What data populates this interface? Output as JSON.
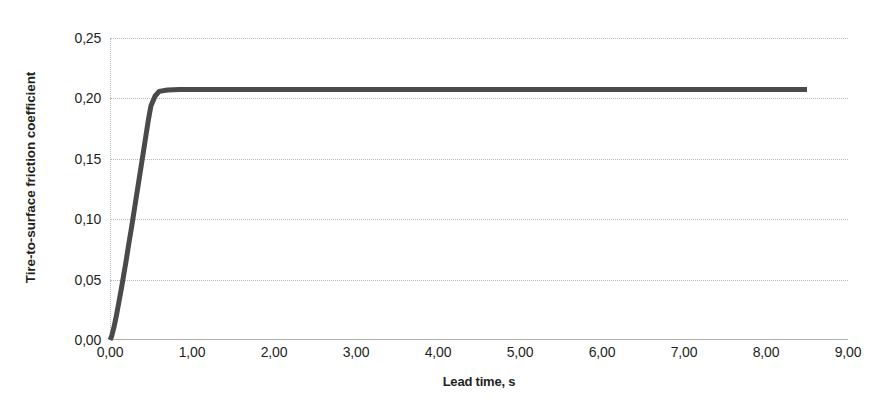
{
  "chart_data": {
    "type": "line",
    "title": "",
    "xlabel": "Lead time, s",
    "ylabel": "Tire-to-surface friction coefficient",
    "xlim": [
      0,
      9
    ],
    "ylim": [
      0,
      0.25
    ],
    "grid": true,
    "legend": false,
    "legend_position": "none",
    "decimal_separator": ",",
    "xticks": [
      0,
      1,
      2,
      3,
      4,
      5,
      6,
      7,
      8,
      9
    ],
    "xtick_labels": [
      "0,00",
      "1,00",
      "2,00",
      "3,00",
      "4,00",
      "5,00",
      "6,00",
      "7,00",
      "8,00",
      "9,00"
    ],
    "yticks": [
      0,
      0.05,
      0.1,
      0.15,
      0.2,
      0.25
    ],
    "ytick_labels": [
      "0,00",
      "0,05",
      "0,10",
      "0,15",
      "0,20",
      "0,25"
    ],
    "series": [
      {
        "name": "Tire-to-surface friction coefficient",
        "color": "#4a4a4a",
        "line_width": 5,
        "x": [
          0.0,
          0.02,
          0.05,
          0.08,
          0.11,
          0.14,
          0.17,
          0.2,
          0.23,
          0.26,
          0.29,
          0.32,
          0.35,
          0.38,
          0.41,
          0.44,
          0.47,
          0.5,
          0.55,
          0.6,
          0.7,
          0.85,
          1.0,
          1.5,
          2.0,
          2.5,
          3.0,
          3.5,
          4.0,
          4.5,
          5.0,
          5.5,
          6.0,
          6.5,
          7.0,
          7.5,
          8.0,
          8.25,
          8.5
        ],
        "y": [
          0.0,
          0.003,
          0.011,
          0.021,
          0.032,
          0.043,
          0.055,
          0.067,
          0.08,
          0.092,
          0.105,
          0.118,
          0.131,
          0.144,
          0.157,
          0.17,
          0.183,
          0.194,
          0.202,
          0.2058,
          0.207,
          0.2073,
          0.2074,
          0.2074,
          0.2074,
          0.2074,
          0.2074,
          0.2074,
          0.2074,
          0.2074,
          0.2074,
          0.2074,
          0.2074,
          0.2074,
          0.2074,
          0.2074,
          0.2074,
          0.2074,
          0.2074
        ]
      }
    ],
    "annotations": {
      "plateau_value": "0,207",
      "series_end_x": "8,50"
    }
  },
  "axes": {
    "y_title": "Tire-to-surface friction coefficient",
    "x_title": "Lead time, s"
  },
  "colors": {
    "series": "#4a4a4a",
    "gridline": "#b9b9b9",
    "axis": "#b0b0b0",
    "text": "#231f20",
    "background": "#ffffff"
  }
}
